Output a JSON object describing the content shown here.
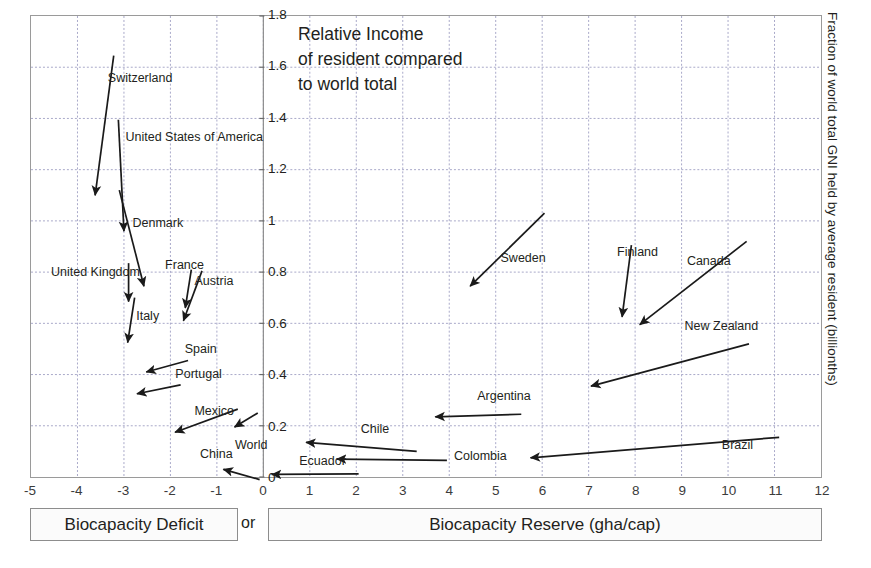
{
  "chart_data": {
    "type": "scatter",
    "title": "Relative Income\nof resident compared\nto world total",
    "xlabel": "Biocapacity Reserve (gha/cap)",
    "ylabel": "Fraction of world total GNI held by average resident (billionths)",
    "xlim": [
      -5,
      12
    ],
    "ylim": [
      0,
      1.8
    ],
    "grid": true,
    "legend": "none",
    "xticks": [
      "-5",
      "-4",
      "-3",
      "-2",
      "-1",
      "0",
      "1",
      "2",
      "3",
      "4",
      "5",
      "6",
      "7",
      "8",
      "9",
      "10",
      "11",
      "12"
    ],
    "xtick_values": [
      -5,
      -4,
      -3,
      -2,
      -1,
      0,
      1,
      2,
      3,
      4,
      5,
      6,
      7,
      8,
      9,
      10,
      11,
      12
    ],
    "yticks": [
      "0",
      "0.2",
      "0.4",
      "0.6",
      "0.8",
      "1",
      "1.2",
      "1.4",
      "1.6",
      "1.8"
    ],
    "ytick_values": [
      0,
      0.2,
      0.4,
      0.6,
      0.8,
      1,
      1.2,
      1.4,
      1.6,
      1.8
    ],
    "annotation_style": "labelled arrows pointing at data points",
    "points": [
      {
        "name": "Switzerland",
        "x": -3.62,
        "y": 1.1,
        "label_x": -3.33,
        "label_y": 1.555,
        "tail_x": -3.22,
        "tail_y": 1.645,
        "label_anchor": "left"
      },
      {
        "name": "United States of America",
        "x": -3.0,
        "y": 0.96,
        "label_x": -2.95,
        "label_y": 1.325,
        "tail_x": -3.12,
        "tail_y": 1.395,
        "label_anchor": "left"
      },
      {
        "name": "Denmark",
        "x": -2.57,
        "y": 0.745,
        "label_x": -2.8,
        "label_y": 0.99,
        "tail_x": -3.1,
        "tail_y": 1.12,
        "label_anchor": "left"
      },
      {
        "name": "United Kingdom",
        "x": -2.9,
        "y": 0.685,
        "label_x": -4.55,
        "label_y": 0.8,
        "tail_x": -2.9,
        "tail_y": 0.835,
        "label_anchor": "left"
      },
      {
        "name": "Italy",
        "x": -2.92,
        "y": 0.525,
        "label_x": -2.72,
        "label_y": 0.63,
        "tail_x": -2.77,
        "tail_y": 0.7,
        "label_anchor": "left"
      },
      {
        "name": "France",
        "x": -1.68,
        "y": 0.66,
        "label_x": -2.1,
        "label_y": 0.83,
        "tail_x": -1.55,
        "tail_y": 0.81,
        "label_anchor": "left"
      },
      {
        "name": "Austria",
        "x": -1.72,
        "y": 0.61,
        "label_x": -1.47,
        "label_y": 0.765,
        "tail_x": -1.32,
        "tail_y": 0.805,
        "label_anchor": "left"
      },
      {
        "name": "Spain",
        "x": -2.52,
        "y": 0.41,
        "label_x": -1.68,
        "label_y": 0.5,
        "tail_x": -1.62,
        "tail_y": 0.455,
        "label_anchor": "left"
      },
      {
        "name": "Portugal",
        "x": -2.72,
        "y": 0.325,
        "label_x": -1.88,
        "label_y": 0.405,
        "tail_x": -1.78,
        "tail_y": 0.36,
        "label_anchor": "left"
      },
      {
        "name": "Mexico",
        "x": -1.9,
        "y": 0.175,
        "label_x": -1.47,
        "label_y": 0.26,
        "tail_x": -0.55,
        "tail_y": 0.265,
        "label_anchor": "left"
      },
      {
        "name": "World",
        "x": -0.62,
        "y": 0.195,
        "label_x": -0.6,
        "label_y": 0.13,
        "tail_x": -0.12,
        "tail_y": 0.25,
        "label_anchor": "left"
      },
      {
        "name": "China",
        "x": -0.86,
        "y": 0.03,
        "label_x": -1.35,
        "label_y": 0.095,
        "tail_x": -0.08,
        "tail_y": -0.01,
        "label_anchor": "left"
      },
      {
        "name": "Ecuador",
        "x": 0.18,
        "y": 0.01,
        "label_x": 0.78,
        "label_y": 0.065,
        "tail_x": 2.05,
        "tail_y": 0.012,
        "label_anchor": "left"
      },
      {
        "name": "Chile",
        "x": 0.92,
        "y": 0.135,
        "label_x": 2.1,
        "label_y": 0.19,
        "tail_x": 3.3,
        "tail_y": 0.1,
        "label_anchor": "left"
      },
      {
        "name": "Colombia",
        "x": 1.58,
        "y": 0.07,
        "label_x": 4.1,
        "label_y": 0.085,
        "tail_x": 3.95,
        "tail_y": 0.065,
        "label_anchor": "left"
      },
      {
        "name": "Argentina",
        "x": 3.7,
        "y": 0.235,
        "label_x": 4.6,
        "label_y": 0.32,
        "tail_x": 5.55,
        "tail_y": 0.245,
        "label_anchor": "left"
      },
      {
        "name": "Sweden",
        "x": 4.45,
        "y": 0.745,
        "label_x": 5.1,
        "label_y": 0.855,
        "tail_x": 6.05,
        "tail_y": 1.03,
        "label_anchor": "left"
      },
      {
        "name": "Finland",
        "x": 7.72,
        "y": 0.625,
        "label_x": 7.6,
        "label_y": 0.88,
        "tail_x": 7.92,
        "tail_y": 0.905,
        "label_anchor": "left"
      },
      {
        "name": "Canada",
        "x": 8.1,
        "y": 0.595,
        "label_x": 9.1,
        "label_y": 0.845,
        "tail_x": 10.4,
        "tail_y": 0.92,
        "label_anchor": "left"
      },
      {
        "name": "New Zealand",
        "x": 7.05,
        "y": 0.355,
        "label_x": 9.05,
        "label_y": 0.59,
        "tail_x": 10.45,
        "tail_y": 0.52,
        "label_anchor": "left"
      },
      {
        "name": "Brazil",
        "x": 5.75,
        "y": 0.075,
        "label_x": 9.85,
        "label_y": 0.13,
        "tail_x": 11.1,
        "tail_y": 0.155,
        "label_anchor": "left"
      }
    ]
  },
  "footer": {
    "deficit_label": "Biocapacity Deficit",
    "or_label": "or",
    "reserve_label": "Biocapacity Reserve (gha/cap)"
  },
  "colors": {
    "arrow": "#1a1a1a",
    "grid": "#a9a9c9",
    "frame": "#9a9a9a",
    "text": "#231f20",
    "background": "#ffffff"
  }
}
